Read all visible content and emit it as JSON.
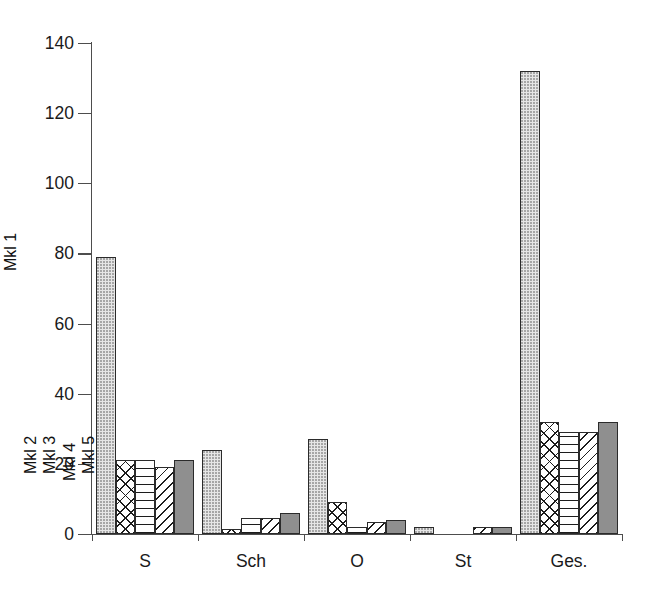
{
  "chart_data": {
    "type": "bar",
    "title": "",
    "xlabel": "",
    "ylabel": "",
    "ylim": [
      0,
      140
    ],
    "yticks": [
      0,
      20,
      40,
      60,
      80,
      100,
      120,
      140
    ],
    "grid": false,
    "legend_position": "inline-annotations-above-bars",
    "categories": [
      "S",
      "Sch",
      "O",
      "St",
      "Ges."
    ],
    "series": [
      {
        "name": "Mkl 1",
        "pattern": "light-dotted",
        "color": "#e6e6e6",
        "values": [
          79,
          24,
          27,
          2,
          132
        ]
      },
      {
        "name": "Mkl 2",
        "pattern": "cross-hatch",
        "color": "#ffffff",
        "values": [
          21,
          1.5,
          9,
          0,
          32
        ]
      },
      {
        "name": "Mkl 3",
        "pattern": "horizontal-lines",
        "color": "#ffffff",
        "values": [
          21,
          4.5,
          2,
          0,
          29
        ]
      },
      {
        "name": "Mkl 4",
        "pattern": "diagonal-hatch",
        "color": "#ffffff",
        "values": [
          19,
          4.5,
          3.5,
          2,
          29
        ]
      },
      {
        "name": "Mkl 5",
        "pattern": "solid-gray",
        "color": "#8f8f8f",
        "values": [
          21,
          6,
          4,
          2,
          32
        ]
      }
    ],
    "annotations": [
      {
        "text": "Mkl 1",
        "category": "S",
        "series": "Mkl 1"
      },
      {
        "text": "Mkl 2",
        "category": "S",
        "series": "Mkl 2"
      },
      {
        "text": "Mkl 3",
        "category": "S",
        "series": "Mkl 3"
      },
      {
        "text": "Mkl 4",
        "category": "S",
        "series": "Mkl 4"
      },
      {
        "text": "Mkl 5",
        "category": "S",
        "series": "Mkl 5"
      }
    ]
  }
}
